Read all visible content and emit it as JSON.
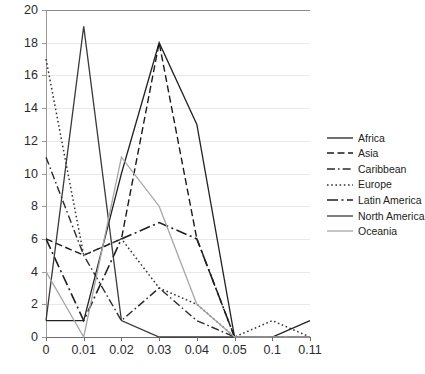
{
  "chart_data": {
    "type": "line",
    "title": "",
    "xlabel": "",
    "ylabel": "",
    "categories": [
      "0",
      "0.01",
      "0.02",
      "0.03",
      "0.04",
      "0.05",
      "0.1",
      "0.11"
    ],
    "ylim": [
      0,
      20
    ],
    "ytick_labels": [
      "0",
      "2",
      "4",
      "6",
      "8",
      "10",
      "12",
      "14",
      "16",
      "18",
      "20"
    ],
    "ytick_values": [
      0,
      2,
      4,
      6,
      8,
      10,
      12,
      14,
      16,
      18,
      20
    ],
    "grid": true,
    "legend_position": "right",
    "series": [
      {
        "name": "Africa",
        "values": [
          1,
          1,
          10,
          18,
          13,
          0,
          0,
          1
        ],
        "style": "solid",
        "color": "#222222",
        "width": 1.3
      },
      {
        "name": "Asia",
        "values": [
          6,
          5,
          6,
          18,
          6,
          0,
          0,
          0
        ],
        "style": "dashed",
        "color": "#1a1a1a",
        "width": 1.4
      },
      {
        "name": "Caribbean",
        "values": [
          11,
          5,
          1,
          3,
          1,
          0,
          0,
          0
        ],
        "style": "dashdot",
        "color": "#2b2b2b",
        "width": 1.4
      },
      {
        "name": "Europe",
        "values": [
          17,
          5,
          6,
          3,
          2,
          0,
          1,
          0
        ],
        "style": "dotted",
        "color": "#333333",
        "width": 1.5
      },
      {
        "name": "Latin America",
        "values": [
          6,
          1,
          6,
          7,
          6,
          0,
          0,
          0
        ],
        "style": "longdashdot",
        "color": "#1f1f1f",
        "width": 1.6
      },
      {
        "name": "North America",
        "values": [
          1,
          19,
          1,
          0,
          0,
          0,
          0,
          0
        ],
        "style": "solid",
        "color": "#3a3a3a",
        "width": 1.3
      },
      {
        "name": "Oceania",
        "values": [
          4,
          0,
          11,
          8,
          2,
          0,
          0,
          0
        ],
        "style": "solid",
        "color": "#a6a6a6",
        "width": 1.3
      }
    ]
  }
}
